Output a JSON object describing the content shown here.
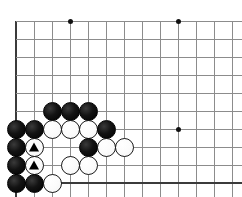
{
  "diagram": {
    "kind": "go-board-corner-diagram",
    "board_size": 19,
    "view": "lower-left corner",
    "background_color": "#ffffff",
    "line_color": "#8c8c8c",
    "edge_color": "#3b3b3b",
    "black_color": "#000000",
    "white_color": "#ffffff",
    "grid": {
      "origin_x": 16,
      "origin_y": 21,
      "spacing": 18,
      "columns": 13,
      "rows": 10,
      "left_edge": true,
      "bottom_edge": true,
      "top_edge": false,
      "right_edge": false
    },
    "star_points": [
      {
        "col": 3,
        "row": 0
      },
      {
        "col": 9,
        "row": 0
      },
      {
        "col": 9,
        "row": 6
      }
    ],
    "stones": [
      {
        "col": 2,
        "row": 5,
        "color": "black",
        "mark": ""
      },
      {
        "col": 3,
        "row": 5,
        "color": "black",
        "mark": ""
      },
      {
        "col": 4,
        "row": 5,
        "color": "black",
        "mark": ""
      },
      {
        "col": 0,
        "row": 6,
        "color": "black",
        "mark": ""
      },
      {
        "col": 1,
        "row": 6,
        "color": "black",
        "mark": ""
      },
      {
        "col": 2,
        "row": 6,
        "color": "white",
        "mark": ""
      },
      {
        "col": 3,
        "row": 6,
        "color": "white",
        "mark": ""
      },
      {
        "col": 4,
        "row": 6,
        "color": "white",
        "mark": ""
      },
      {
        "col": 5,
        "row": 6,
        "color": "black",
        "mark": ""
      },
      {
        "col": 0,
        "row": 7,
        "color": "black",
        "mark": ""
      },
      {
        "col": 1,
        "row": 7,
        "color": "white",
        "mark": "triangle"
      },
      {
        "col": 4,
        "row": 7,
        "color": "black",
        "mark": ""
      },
      {
        "col": 5,
        "row": 7,
        "color": "white",
        "mark": ""
      },
      {
        "col": 6,
        "row": 7,
        "color": "white",
        "mark": ""
      },
      {
        "col": 0,
        "row": 8,
        "color": "black",
        "mark": ""
      },
      {
        "col": 1,
        "row": 8,
        "color": "white",
        "mark": "triangle"
      },
      {
        "col": 3,
        "row": 8,
        "color": "white",
        "mark": ""
      },
      {
        "col": 4,
        "row": 8,
        "color": "white",
        "mark": ""
      },
      {
        "col": 0,
        "row": 9,
        "color": "black",
        "mark": ""
      },
      {
        "col": 1,
        "row": 9,
        "color": "black",
        "mark": ""
      },
      {
        "col": 2,
        "row": 9,
        "color": "white",
        "mark": ""
      }
    ]
  }
}
